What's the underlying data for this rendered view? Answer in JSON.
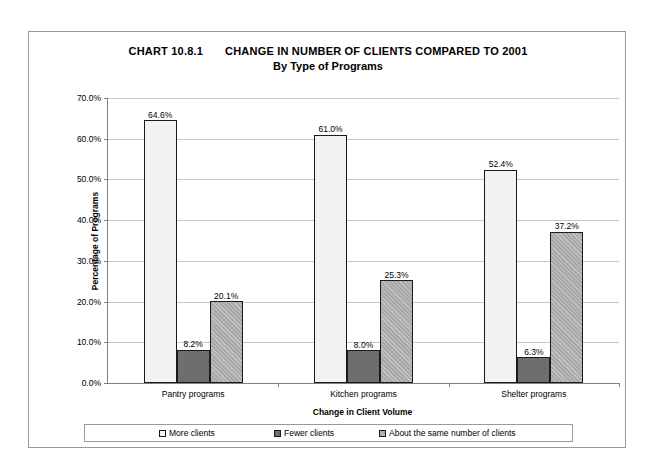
{
  "chart_data": {
    "type": "bar",
    "title": "CHANGE IN NUMBER OF CLIENTS COMPARED TO 2001",
    "subtitle": "By Type of Programs",
    "chart_number": "CHART 10.8.1",
    "xlabel": "Change in Client Volume",
    "ylabel": "Percentage of Programs",
    "categories": [
      "Pantry programs",
      "Kitchen programs",
      "Shelter programs"
    ],
    "series": [
      {
        "name": "More clients",
        "values": [
          64.6,
          61.0,
          52.4
        ],
        "labels": [
          "64.6%",
          "61.0%",
          "52.4%"
        ],
        "color": "#f2f2f2"
      },
      {
        "name": "Fewer clients",
        "values": [
          8.2,
          8.0,
          6.3
        ],
        "labels": [
          "8.2%",
          "8.0%",
          "6.3%"
        ],
        "color": "#6e6e6e"
      },
      {
        "name": "About the same number of clients",
        "values": [
          20.1,
          25.3,
          37.2
        ],
        "labels": [
          "20.1%",
          "25.3%",
          "37.2%"
        ],
        "color": "#a9a9a9"
      }
    ],
    "ylim": [
      0,
      70
    ],
    "ytick_values": [
      0,
      10,
      20,
      30,
      40,
      50,
      60,
      70
    ],
    "ytick_labels": [
      "0.0%",
      "10.0%",
      "20.0%",
      "30.0%",
      "40.0%",
      "50.0%",
      "60.0%",
      "70.0%"
    ],
    "grid": "horizontal",
    "legend_position": "bottom"
  }
}
